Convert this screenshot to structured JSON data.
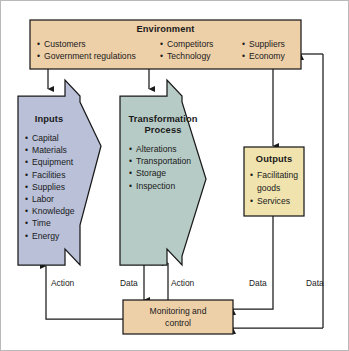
{
  "diagram": {
    "colors": {
      "environment_fill": "#edcfa8",
      "inputs_fill": "#b9c0d8",
      "transformation_fill": "#b6cbc5",
      "outputs_fill": "#f0e3ae",
      "monitoring_fill": "#edcfa8",
      "stroke": "#1a1a1a",
      "background": "#ffffff"
    },
    "environment": {
      "title": "Environment",
      "column1": [
        "Customers",
        "Government regulations"
      ],
      "column2": [
        "Competitors",
        "Technology"
      ],
      "column3": [
        "Suppliers",
        "Economy"
      ]
    },
    "inputs": {
      "title": "Inputs",
      "items": [
        "Capital",
        "Materials",
        "Equipment",
        "Facilities",
        "Supplies",
        "Labor",
        "Knowledge",
        "Time",
        "Energy"
      ]
    },
    "transformation": {
      "title_line1": "Transformation",
      "title_line2": "Process",
      "items": [
        "Alterations",
        "Transportation",
        "Storage",
        "Inspection"
      ]
    },
    "outputs": {
      "title": "Outputs",
      "items": [
        "Facilitating",
        "goods",
        "Services"
      ]
    },
    "monitoring": {
      "title_line1": "Monitoring and",
      "title_line2": "control"
    },
    "flow_labels": {
      "action_inputs": "Action",
      "data_transformation": "Data",
      "action_transformation": "Action",
      "data_outputs": "Data",
      "data_environment": "Data"
    }
  }
}
